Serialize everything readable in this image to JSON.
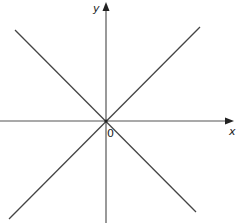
{
  "diagram": {
    "type": "coordinate-axes-with-lines",
    "axes": {
      "x_label": "x",
      "y_label": "y",
      "origin_label": "0"
    },
    "lines": [
      {
        "name": "line-positive-slope",
        "description": "line through origin rising left-to-right"
      },
      {
        "name": "line-negative-slope",
        "description": "line through origin falling left-to-right"
      }
    ],
    "colors": {
      "line": "#444444",
      "axis": "#555555",
      "text": "#222222",
      "background": "#ffffff"
    }
  }
}
